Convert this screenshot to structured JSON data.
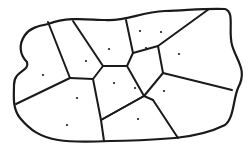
{
  "diagram": {
    "type": "voronoi",
    "background": "#ffffff",
    "stroke": "#1a1a1a",
    "boundary": "M48,24 C70,16 90,20 105,20 C125,22 140,12 165,11 C190,10 210,8 225,9 C235,12 228,30 232,45 C236,60 248,70 238,88 C233,100 234,118 225,125 C205,135 185,137 175,138 C150,140 130,141 110,141 C90,142 70,142 58,140 C40,137 30,130 20,118 C12,108 14,95 14,85 C14,70 30,72 27,62 C20,55 18,45 25,35 C30,28 38,26 48,24 Z",
    "edges": [
      "M48,22 L70,78",
      "M73,21 L103,66",
      "M103,66 L127,66",
      "M127,66 L133,53",
      "M133,53 L126,20",
      "M133,53 L158,46",
      "M158,46 L209,9",
      "M158,46 L163,73",
      "M163,73 L232,90",
      "M163,73 L144,96",
      "M144,96 L127,66",
      "M103,66 L93,79",
      "M93,79 L70,78",
      "M70,78 L16,104",
      "M93,79 L101,120",
      "M101,120 L104,141",
      "M101,120 L144,96",
      "M144,96 L153,100",
      "M153,100 L178,138",
      "M101,120 L144,96"
    ],
    "sites": [
      {
        "x": 43,
        "y": 75
      },
      {
        "x": 86,
        "y": 61
      },
      {
        "x": 109,
        "y": 49
      },
      {
        "x": 146,
        "y": 48
      },
      {
        "x": 161,
        "y": 32
      },
      {
        "x": 179,
        "y": 54
      },
      {
        "x": 135,
        "y": 88
      },
      {
        "x": 114,
        "y": 83
      },
      {
        "x": 77,
        "y": 98
      },
      {
        "x": 67,
        "y": 125
      },
      {
        "x": 138,
        "y": 119
      },
      {
        "x": 164,
        "y": 91
      },
      {
        "x": 140,
        "y": 31
      }
    ]
  }
}
